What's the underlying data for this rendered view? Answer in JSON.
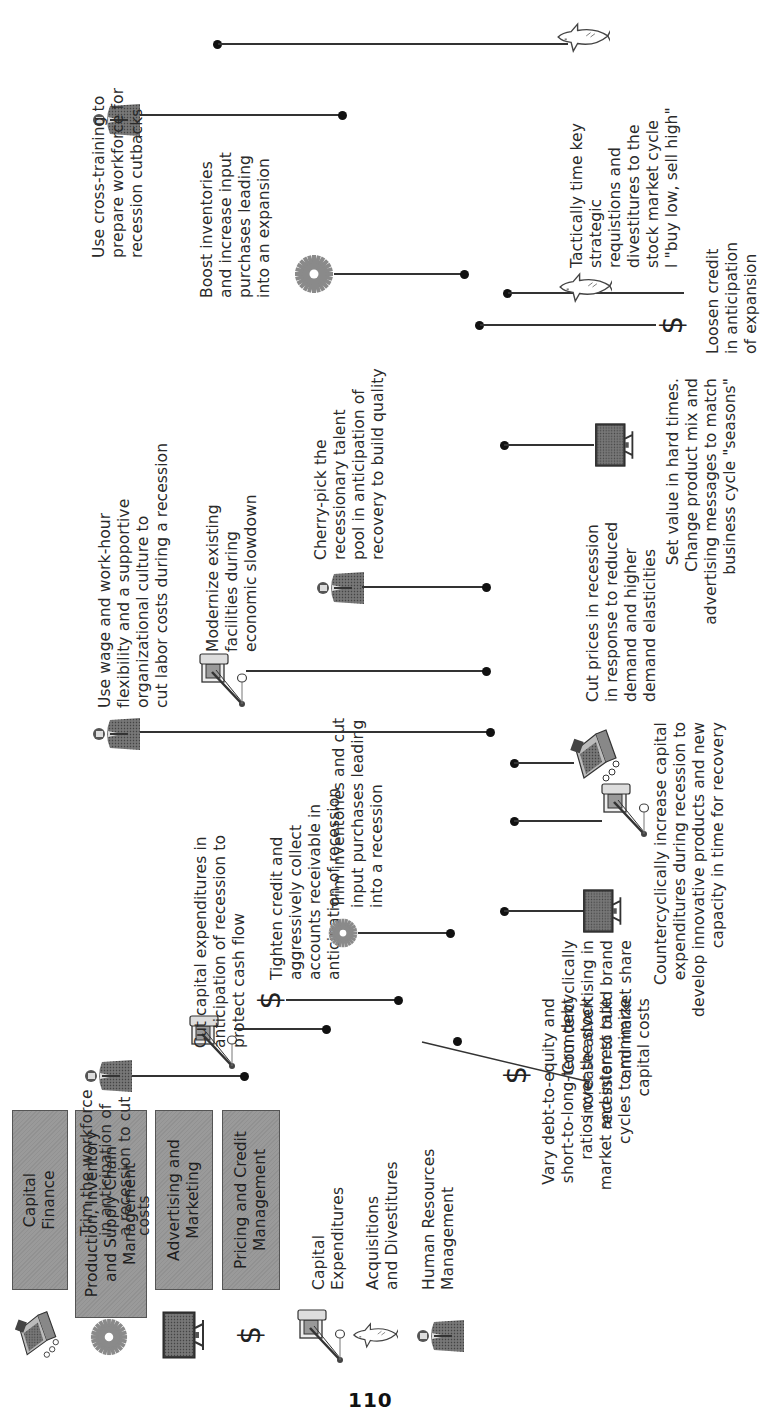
{
  "page_number": "110",
  "legend": {
    "categories": [
      {
        "icon": "cash-register-icon",
        "label": "Capital\nFinance"
      },
      {
        "icon": "gear-icon",
        "label": "Production, Inventory\nand Supply Chain\nManagement"
      },
      {
        "icon": "television-icon",
        "label": "Advertising and\nMarketing"
      },
      {
        "icon": "dollar-icon",
        "label": "Pricing and Credit\nManagement"
      }
    ],
    "subcategories": [
      {
        "icon": "crane-icon",
        "label": "Capital\nExpenditures"
      },
      {
        "icon": "shark-icon",
        "label": "Acquisitions\nand Divestitures"
      },
      {
        "icon": "businessman-icon",
        "label": "Human Resources\nManagement"
      }
    ]
  },
  "strategies": [
    {
      "id": "vary-debt",
      "icon": "dollar-icon",
      "text": "Vary debt-to-equity and\nshort-to-long-term debt\nratios over the stock\nmarket and interest rate\ncycles to minimize\ncapital costs"
    },
    {
      "id": "trim-workforce",
      "icon": "businessman-icon",
      "text": "Trim the workforce\nin anticipation of\na recession to cut\ncosts"
    },
    {
      "id": "cut-capex",
      "icon": "crane-icon",
      "text": "Cut capital expenditures in\nanticipation of recession to\nprotect cash flow"
    },
    {
      "id": "tighten-credit",
      "icon": "dollar-icon",
      "text": "Tighten credit and\naggressively collect\naccounts receivable in\nanticipation of recession"
    },
    {
      "id": "trim-inventories",
      "icon": "gear-icon",
      "text": "Trim inventories and cut\ninput purchases leading\ninto a recession"
    },
    {
      "id": "increase-advertising",
      "icon": "television-icon",
      "text": "Countercyclically\nincrease advertising in\nrecession to build brand\nand market share"
    },
    {
      "id": "increase-capex",
      "icon": "crane-icon",
      "text": "Countercyclically increase capital\nexpenditures during recession to\ndevelop innovative products and new\ncapacity in time for recovery"
    },
    {
      "id": "cut-prices",
      "icon": "cash-register-icon",
      "text": "Cut prices in recession\nin response to reduced\ndemand and higher\ndemand elasticities"
    },
    {
      "id": "wage-flexibility",
      "icon": "businessman-icon",
      "text": "Use wage and work-hour\nflexibility and a supportive\norganizational culture to\ncut labor costs during a recession"
    },
    {
      "id": "modernize-facilities",
      "icon": "crane-icon",
      "text": "Modernize existing\nfacilities during\neconomic slowdown"
    },
    {
      "id": "cherry-pick",
      "icon": "businessman-icon",
      "text": "Cherry-pick the\nrecessionary talent\npool in anticipation of\nrecovery to build quality"
    },
    {
      "id": "set-value",
      "icon": "television-icon",
      "text": "Set value in hard times.\nChange product mix and\nadvertising messages to match\nbusiness cycle \"seasons\""
    },
    {
      "id": "loosen-credit",
      "icon": "dollar-icon",
      "text": "Loosen credit\nin anticipation\nof expansion"
    },
    {
      "id": "time-acquisitions",
      "icon": "shark-icon",
      "text": "Tactically time key\nstrategic\nrequistions and\ndivestitures to the\nstock market cycle\nl \"buy low, sell high\""
    },
    {
      "id": "boost-inventories",
      "icon": "gear-icon",
      "text": "Boost inventories\nand increase input\npurchases leading\ninto an expansion"
    },
    {
      "id": "cross-training",
      "icon": "businessman-icon",
      "text": "Use cross-training to\nprepare workforce for\nrecession cutbacks"
    }
  ]
}
